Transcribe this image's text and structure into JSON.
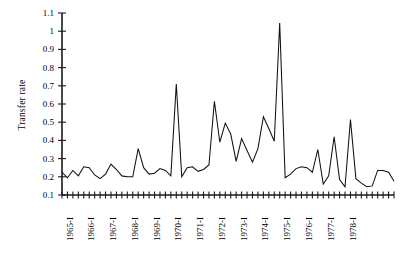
{
  "chart_data": {
    "type": "line",
    "title": "",
    "subtitle": "",
    "xlabel": "",
    "ylabel": "Transfer rate",
    "ylim": [
      0.1,
      1.1
    ],
    "yticks": [
      0.1,
      0.2,
      0.3,
      0.4,
      0.5,
      0.6,
      0.7,
      0.8,
      0.9,
      1.0,
      1.1
    ],
    "ytick_labels": [
      "0.1",
      "0.2",
      "0.3",
      "0.4",
      "0.5",
      "0.6",
      "0.7",
      "0.8",
      "0.9",
      "1",
      "1.1"
    ],
    "grid": false,
    "legend": "none",
    "x_tick_count": 56,
    "x_major_labels": [
      "1965-I",
      "1966-I",
      "1967-I",
      "1968-I",
      "1969-I",
      "1970-I",
      "1971-I",
      "1972-I",
      "1973-I",
      "1974-I",
      "1975-I",
      "1976-I",
      "1977-I",
      "1978-I"
    ],
    "x_major_label_indices": [
      0,
      4,
      8,
      12,
      16,
      20,
      24,
      28,
      32,
      36,
      40,
      44,
      48,
      52
    ],
    "x": [
      "1965-I",
      "1965-II",
      "1965-III",
      "1965-IV",
      "1966-I",
      "1966-II",
      "1966-III",
      "1966-IV",
      "1967-I",
      "1967-II",
      "1967-III",
      "1967-IV",
      "1968-I",
      "1968-II",
      "1968-III",
      "1968-IV",
      "1969-I",
      "1969-II",
      "1969-III",
      "1969-IV",
      "1970-I",
      "1970-II",
      "1970-III",
      "1970-IV",
      "1971-I",
      "1971-II",
      "1971-III",
      "1971-IV",
      "1972-I",
      "1972-II",
      "1972-III",
      "1972-IV",
      "1973-I",
      "1973-II",
      "1973-III",
      "1973-IV",
      "1974-I",
      "1974-II",
      "1974-III",
      "1974-IV",
      "1975-I",
      "1975-II",
      "1975-III",
      "1975-IV",
      "1976-I",
      "1976-II",
      "1976-III",
      "1976-IV",
      "1977-I",
      "1977-II",
      "1977-III",
      "1977-IV",
      "1978-I",
      "1978-II",
      "1978-III",
      "1978-IV"
    ],
    "values": [
      0.225,
      0.195,
      0.235,
      0.205,
      0.255,
      0.25,
      0.21,
      0.19,
      0.215,
      0.27,
      0.24,
      0.205,
      0.2,
      0.2,
      0.355,
      0.25,
      0.215,
      0.22,
      0.245,
      0.235,
      0.205,
      0.71,
      0.2,
      0.25,
      0.255,
      0.23,
      0.24,
      0.265,
      0.615,
      0.39,
      0.495,
      0.435,
      0.285,
      0.41,
      0.345,
      0.28,
      0.355,
      0.53,
      0.465,
      0.395,
      1.045,
      0.195,
      0.215,
      0.245,
      0.255,
      0.25,
      0.225,
      0.35,
      0.16,
      0.205,
      0.42,
      0.185,
      0.145,
      0.515,
      0.19,
      0.165
    ],
    "values_note": "read from the plotted polyline; x index 0 = 1965-I",
    "tail_values": [
      0.145,
      0.15,
      0.235,
      0.235,
      0.225,
      0.175
    ],
    "max": 1.045,
    "min": 0.145,
    "line_color": "#101010"
  }
}
